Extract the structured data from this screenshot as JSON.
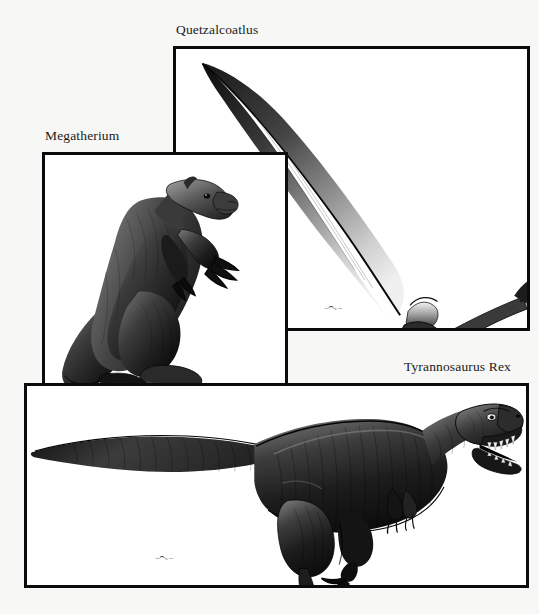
{
  "figure": {
    "type": "illustration-plate",
    "background_color": "#f7f7f5",
    "frame_color": "#0b0b0b",
    "panel_background": "#ffffff",
    "artwork_color": "#111111"
  },
  "panels": [
    {
      "id": "quetzalcoatlus",
      "label": "Quetzalcoatlus",
      "subject": "pterosaur-in-flight",
      "signature": "artist-signature",
      "frame": {
        "x": 173,
        "y": 46,
        "width": 357,
        "height": 285
      },
      "label_position": {
        "x": 176,
        "y": 23
      }
    },
    {
      "id": "megatherium",
      "label": "Megatherium",
      "subject": "giant-ground-sloth-standing",
      "signature": "artist-signature",
      "frame": {
        "x": 42,
        "y": 152,
        "width": 246,
        "height": 252
      },
      "label_position": {
        "x": 45,
        "y": 129
      }
    },
    {
      "id": "tyrannosaurus",
      "label": "Tyrannosaurus Rex",
      "subject": "tyrannosaurus-walking-roaring",
      "signature": "artist-signature",
      "frame": {
        "x": 24,
        "y": 383,
        "width": 505,
        "height": 205
      },
      "label_position": {
        "x": 404,
        "y": 360
      }
    }
  ]
}
